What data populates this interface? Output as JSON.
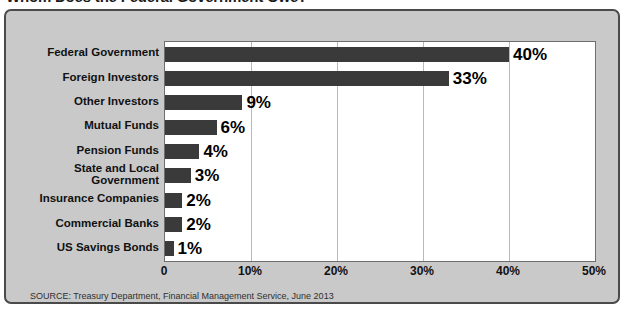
{
  "headline": "Whom Does the Federal Government Owe?",
  "source_note": "SOURCE: Treasury Department, Financial Management Service, June 2013",
  "colors": {
    "bar": "#3a3a3a",
    "panel_bg": "#c9c9c9",
    "plot_bg": "#ffffff",
    "border": "#4a4a4a",
    "gridline": "#b9b9b9",
    "text": "#111111"
  },
  "chart_data": {
    "type": "bar",
    "orientation": "horizontal",
    "title": "Whom Does the Federal Government Owe?",
    "xlabel": "",
    "ylabel": "",
    "xlim": [
      0,
      50
    ],
    "xticks": [
      0,
      10,
      20,
      30,
      40,
      50
    ],
    "xticklabels": [
      "0",
      "10%",
      "20%",
      "30%",
      "40%",
      "50%"
    ],
    "grid": true,
    "legend": false,
    "categories": [
      "Federal Government",
      "Foreign Investors",
      "Other Investors",
      "Mutual Funds",
      "Pension Funds",
      "State and Local Government",
      "Insurance Companies",
      "Commercial Banks",
      "US Savings Bonds"
    ],
    "values": [
      40,
      33,
      9,
      6,
      4,
      3,
      2,
      2,
      1
    ],
    "datalabels": [
      "40%",
      "33%",
      "9%",
      "6%",
      "4%",
      "3%",
      "2%",
      "2%",
      "1%"
    ]
  },
  "category_lines": [
    [
      "Federal Government"
    ],
    [
      "Foreign Investors"
    ],
    [
      "Other Investors"
    ],
    [
      "Mutual Funds"
    ],
    [
      "Pension Funds"
    ],
    [
      "State and Local",
      "Government"
    ],
    [
      "Insurance Companies"
    ],
    [
      "Commercial Banks"
    ],
    [
      "US Savings Bonds"
    ]
  ]
}
